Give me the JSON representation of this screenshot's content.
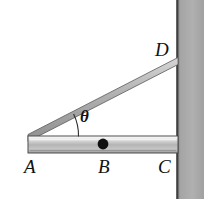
{
  "figure": {
    "background_color": "#ffffff",
    "width": 204,
    "height": 199
  },
  "labels": {
    "point_a": "A",
    "point_b": "B",
    "point_c": "C",
    "point_d": "D",
    "angle": "θ"
  },
  "colors": {
    "wall_fill": "#a8a8a8",
    "wall_edge": "#3a3a3a",
    "rod_light": "#e9e9e9",
    "rod_mid": "#bdbdbd",
    "rod_dark": "#9a9a9a",
    "strut_fill": "#b5b5b5",
    "outline": "#4a4a4a",
    "dot_fill": "#111111",
    "text": "#111111"
  },
  "geometry": {
    "wall": {
      "left": 177,
      "right": 204,
      "top": 0,
      "bottom": 199
    },
    "rod": {
      "x1": 28,
      "x2": 178,
      "top": 136,
      "bottom": 153
    },
    "strut": {
      "ax": 28,
      "ay": 138,
      "dx": 178,
      "dy": 61
    },
    "pivot_dot": {
      "cx": 103,
      "cy": 144,
      "r": 5
    },
    "angle_arc": {
      "vertex_x": 30,
      "vertex_y": 137,
      "radius": 48,
      "start_deg": 0,
      "end_deg": 27
    }
  },
  "label_positions": {
    "point_a": {
      "x": 24,
      "y": 160
    },
    "point_b": {
      "x": 98,
      "y": 160
    },
    "point_c": {
      "x": 159,
      "y": 160
    },
    "point_d": {
      "x": 155,
      "y": 40
    },
    "angle": {
      "x": 80,
      "y": 109
    }
  }
}
